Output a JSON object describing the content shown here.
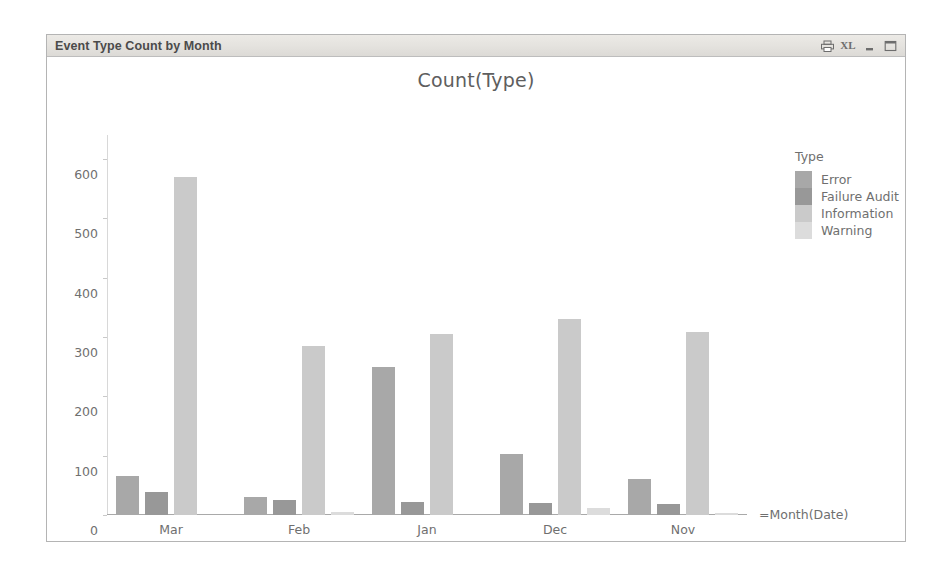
{
  "window": {
    "title": "Event Type Count by Month",
    "buttons": [
      {
        "name": "print-icon",
        "label": ""
      },
      {
        "name": "export-excel-icon",
        "label": "XL"
      },
      {
        "name": "minimize-icon",
        "label": ""
      },
      {
        "name": "maximize-icon",
        "label": ""
      }
    ]
  },
  "chart_data": {
    "type": "bar",
    "title": "Count(Type)",
    "xlabel": "=Month(Date)",
    "ylabel": "",
    "legend_title": "Type",
    "legend_position": "right",
    "grid": false,
    "ylim": [
      0,
      640
    ],
    "yticks": [
      0,
      100,
      200,
      300,
      400,
      500,
      600
    ],
    "categories": [
      "Mar",
      "Feb",
      "Jan",
      "Dec",
      "Nov"
    ],
    "series": [
      {
        "name": "Error",
        "color": "#a8a8a8",
        "values": [
          65,
          30,
          250,
          103,
          60
        ]
      },
      {
        "name": "Failure Audit",
        "color": "#989898",
        "values": [
          38,
          25,
          22,
          20,
          18
        ]
      },
      {
        "name": "Information",
        "color": "#cacaca",
        "values": [
          570,
          285,
          305,
          330,
          308
        ]
      },
      {
        "name": "Warning",
        "color": "#dcdcdc",
        "values": [
          0,
          5,
          0,
          12,
          3
        ]
      }
    ]
  }
}
